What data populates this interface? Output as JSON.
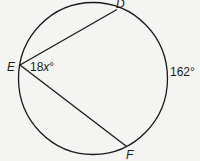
{
  "diagram": {
    "type": "circle-inscribed-angle",
    "points": {
      "D": {
        "label": "D"
      },
      "E": {
        "label": "E"
      },
      "F": {
        "label": "F"
      }
    },
    "angle_label": {
      "coef": "18",
      "var": "x",
      "deg": "°"
    },
    "arc_label": "162°",
    "colors": {
      "stroke": "#1a1a1a",
      "background": "#f4f4f2"
    }
  }
}
